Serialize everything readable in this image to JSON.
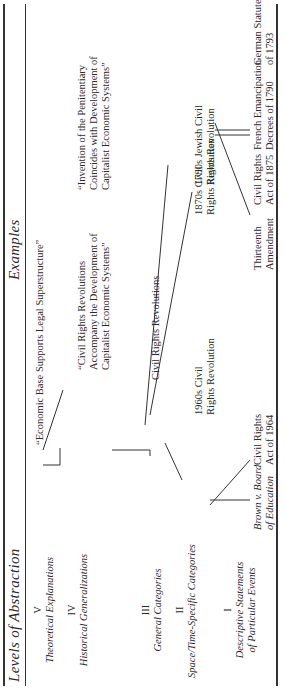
{
  "header": {
    "levels_title": "Levels of Abstraction",
    "examples_title": "Examples"
  },
  "levels": [
    {
      "numeral": "V",
      "label": "Theoretical Explanations"
    },
    {
      "numeral": "IV",
      "label": "Historical Generalizations"
    },
    {
      "numeral": "III",
      "label": "General Categories"
    },
    {
      "numeral": "II",
      "label": "Space/Time-Specific Categories"
    },
    {
      "numeral": "I",
      "label_line1": "Descriptive Statements",
      "label_line2": "of Particular Events"
    }
  ],
  "examples": {
    "theory": "“Economic Base Supports Legal Superstructure”",
    "gen1": {
      "l1": "“Civil Rights Revolutions",
      "l2": "Accompany the Development of",
      "l3": "Capitalist Economic Systems”"
    },
    "gen2": {
      "l1": "“Invention of the Penitentiary",
      "l2": "Coincides with Development of",
      "l3": "Capitalist Economic Systems”"
    },
    "category": "Civil Rights Revolutions",
    "specific": [
      {
        "l1": "1960s Civil",
        "l2": "Rights Revolution"
      },
      {
        "l1": "1870s Civil",
        "l2": "Rights Revolution"
      },
      {
        "l1": "1790s Jewish Civil",
        "l2": "Rights Revolution"
      }
    ],
    "events": [
      {
        "l1": "Brown v. Board",
        "l2": "of Education",
        "italic": true
      },
      {
        "l1": "Civil Rights",
        "l2": "Act of 1964"
      },
      {
        "l1": "Thirteenth",
        "l2": "Amendment"
      },
      {
        "l1": "Civil Rights",
        "l2": "Act of 1875"
      },
      {
        "l1": "French Emancipation",
        "l2": "Decrees of 1790"
      },
      {
        "l1": "German Statutes",
        "l2": "of 1793"
      }
    ]
  }
}
